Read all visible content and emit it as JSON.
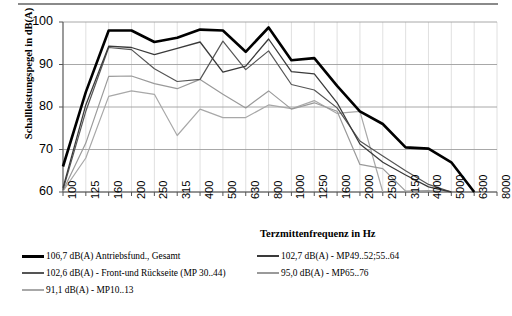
{
  "chart_data": {
    "type": "line",
    "title": "",
    "xlabel": "Terzmittenfrequenz in Hz",
    "ylabel": "Schallleistungspegel in dB(A)",
    "categories": [
      "100",
      "125",
      "160",
      "200",
      "250",
      "315",
      "400",
      "500",
      "630",
      "800",
      "1000",
      "1250",
      "1600",
      "2000",
      "2500",
      "3150",
      "4000",
      "5000",
      "6300",
      "8000"
    ],
    "ylim": [
      60,
      100
    ],
    "yticks": [
      60,
      70,
      80,
      90,
      100
    ],
    "grid": true,
    "legend_position": "below",
    "series": [
      {
        "name": "106,7  dB(A)   Antriebsfund., Gesamt",
        "value_label": "106,7",
        "unit": "dB(A)",
        "description": "Antriebsfund., Gesamt",
        "color": "#000000",
        "width": 2.6,
        "values": [
          66.0,
          83.5,
          98.0,
          98.0,
          95.3,
          96.3,
          98.2,
          98.0,
          93.0,
          98.7,
          91.0,
          91.5,
          85.0,
          79.0,
          76.0,
          70.5,
          70.2,
          67.0,
          59.5,
          null
        ]
      },
      {
        "name": "102,7  dB(A) -  MP49..52;55..64",
        "value_label": "102,7",
        "unit": "dB(A)",
        "description": "MP49..52;55..64",
        "color": "#3a3a3a",
        "width": 1.3,
        "values": [
          61.0,
          80.5,
          94.3,
          94.0,
          92.3,
          93.8,
          95.3,
          88.2,
          89.6,
          96.0,
          88.3,
          87.8,
          81.0,
          71.3,
          67.0,
          64.0,
          61.2,
          59.8,
          null,
          null
        ]
      },
      {
        "name": "102,6  dB(A) -   Front-und Rückseite (MP 30..44)",
        "value_label": "102,6",
        "unit": "dB(A)",
        "description": "Front-und Rückseite (MP 30..44)",
        "color": "#555555",
        "width": 1.2,
        "values": [
          60.5,
          79.0,
          94.0,
          93.5,
          89.0,
          86.0,
          86.5,
          95.5,
          88.8,
          93.2,
          85.3,
          84.0,
          79.8,
          72.0,
          68.5,
          65.0,
          61.8,
          59.7,
          null,
          null
        ]
      },
      {
        "name": "95,0  dB(A) -   MP65..76",
        "value_label": "95,0",
        "unit": "dB(A)",
        "description": "MP65..76",
        "color": "#9a9a9a",
        "width": 1.2,
        "values": [
          60.3,
          71.5,
          87.2,
          87.3,
          85.5,
          84.3,
          86.5,
          83.0,
          79.8,
          83.8,
          79.5,
          81.0,
          79.0,
          66.5,
          65.5,
          60.2,
          60.3,
          60.0,
          null,
          null
        ]
      },
      {
        "name": "91,1  dB(A) -   MP10..13",
        "value_label": "91,1",
        "unit": "dB(A)",
        "description": "MP10..13",
        "color": "#a8a8a8",
        "width": 1.2,
        "values": [
          60.2,
          68.0,
          82.5,
          83.8,
          83.0,
          73.3,
          79.5,
          77.5,
          77.5,
          80.5,
          79.6,
          81.5,
          78.5,
          79.0,
          59.8,
          null,
          61.7,
          null,
          null,
          null
        ]
      }
    ]
  },
  "axis": {
    "y_ticks": [
      "100",
      "90",
      "80",
      "70",
      "60"
    ],
    "x_ticks": [
      "100",
      "125",
      "160",
      "200",
      "250",
      "315",
      "400",
      "500",
      "630",
      "800",
      "1000",
      "1250",
      "1600",
      "2000",
      "2500",
      "3150",
      "4000",
      "5000",
      "6300",
      "8000"
    ],
    "y_title": "Schallleistungspegel in dB(A)",
    "x_title": "Terzmittenfrequenz in Hz"
  },
  "legend": {
    "items": [
      {
        "label": "106,7  dB(A)   Antriebsfund., Gesamt",
        "color": "#000000",
        "thickness": "3px"
      },
      {
        "label": "102,7  dB(A) -  MP49..52;55..64",
        "color": "#3a3a3a",
        "thickness": "1.6px"
      },
      {
        "label": "102,6  dB(A) -   Front-und Rückseite (MP 30..44)",
        "color": "#555555",
        "thickness": "1.4px"
      },
      {
        "label": "95,0  dB(A) -   MP65..76",
        "color": "#9a9a9a",
        "thickness": "1.2px"
      },
      {
        "label": "91,1  dB(A) -   MP10..13",
        "color": "#a8a8a8",
        "thickness": "1.2px"
      }
    ]
  }
}
